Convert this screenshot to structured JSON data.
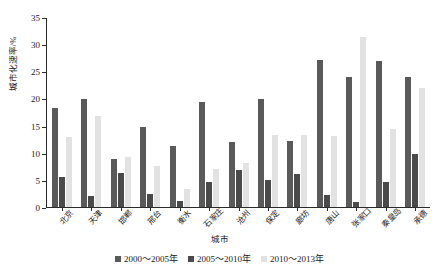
{
  "chart_data": {
    "type": "bar",
    "title": "",
    "xlabel": "城市",
    "ylabel": "城市化速率/%",
    "ylim": [
      0,
      35
    ],
    "yticks": [
      0,
      5,
      10,
      15,
      20,
      25,
      30,
      35
    ],
    "grid": false,
    "legend_position": "bottom",
    "categories": [
      "北京",
      "天津",
      "邯郸",
      "邢台",
      "衡水",
      "石家庄",
      "沧州",
      "保定",
      "廊坊",
      "唐山",
      "张家口",
      "秦皇岛",
      "承德"
    ],
    "series": [
      {
        "name": "2000～2005年",
        "color": "#5a5a5a",
        "values": [
          18.3,
          19.9,
          8.8,
          14.7,
          11.3,
          19.3,
          12.0,
          19.9,
          12.2,
          27.0,
          23.9,
          26.9,
          24.0
        ]
      },
      {
        "name": "2005～2010年",
        "color": "#4a4a4a",
        "values": [
          5.5,
          2.1,
          6.2,
          2.4,
          1.2,
          4.7,
          6.8,
          5.0,
          6.0,
          2.2,
          1.0,
          4.7,
          9.8
        ]
      },
      {
        "name": "2010～2013年",
        "color": "#e2e2e2",
        "values": [
          12.9,
          16.7,
          9.2,
          7.5,
          3.4,
          7.0,
          8.2,
          13.2,
          13.2,
          13.0,
          31.4,
          14.4,
          22.0
        ]
      }
    ]
  },
  "legend": {
    "items": [
      {
        "label": "2000～2005年"
      },
      {
        "label": "2005～2010年"
      },
      {
        "label": "2010～2013年"
      }
    ]
  },
  "axes": {
    "y_title": "城市化速率/%",
    "x_title": "城市"
  }
}
